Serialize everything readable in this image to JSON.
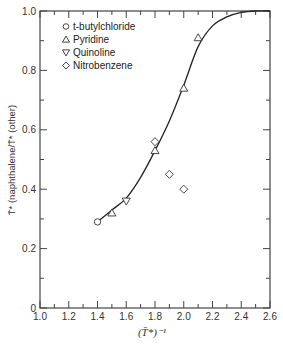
{
  "chart_data": {
    "type": "scatter",
    "title": "",
    "xlabel": "(T̄*)⁻¹",
    "ylabel": "T̄* (naphthalene/T̄* (other)",
    "xlim": [
      1.0,
      2.6
    ],
    "ylim": [
      0,
      1.0
    ],
    "x_ticks": [
      "1.0",
      "1.2",
      "1.4",
      "1.6",
      "1.8",
      "2.0",
      "2.2",
      "2.4",
      "2.6"
    ],
    "y_ticks": [
      "0",
      "0.2",
      "0.4",
      "0.6",
      "0.8",
      "1.0"
    ],
    "grid": false,
    "legend_position": "upper-left",
    "series": [
      {
        "name": "t-butylchloride",
        "marker": "circle",
        "points": [
          [
            1.4,
            0.29
          ]
        ]
      },
      {
        "name": "Pyridine",
        "marker": "triangle-up",
        "points": [
          [
            1.5,
            0.32
          ],
          [
            1.8,
            0.53
          ],
          [
            2.0,
            0.74
          ],
          [
            2.1,
            0.91
          ]
        ]
      },
      {
        "name": "Quinoline",
        "marker": "triangle-down",
        "points": [
          [
            1.6,
            0.36
          ]
        ]
      },
      {
        "name": "Nitrobenzene",
        "marker": "diamond",
        "points": [
          [
            1.8,
            0.56
          ],
          [
            1.9,
            0.45
          ],
          [
            2.0,
            0.4
          ]
        ]
      }
    ],
    "fit_curve": {
      "description": "sigmoidal fitted line",
      "points": [
        [
          1.4,
          0.29
        ],
        [
          1.5,
          0.33
        ],
        [
          1.6,
          0.37
        ],
        [
          1.7,
          0.44
        ],
        [
          1.8,
          0.53
        ],
        [
          1.9,
          0.63
        ],
        [
          2.0,
          0.75
        ],
        [
          2.1,
          0.88
        ],
        [
          2.2,
          0.95
        ],
        [
          2.3,
          0.98
        ],
        [
          2.4,
          0.995
        ],
        [
          2.5,
          1.0
        ],
        [
          2.6,
          1.0
        ]
      ]
    }
  },
  "legend": {
    "items": [
      {
        "symbol": "○",
        "label": "t-butylchloride"
      },
      {
        "symbol": "△",
        "label": "Pyridine"
      },
      {
        "symbol": "▽",
        "label": "Quinoline"
      },
      {
        "symbol": "◇",
        "label": "Nitrobenzene"
      }
    ]
  }
}
